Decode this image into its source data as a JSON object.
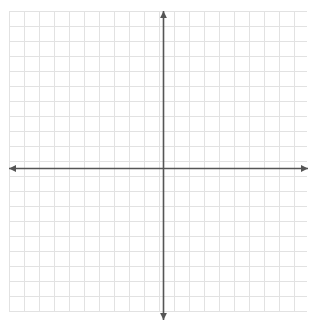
{
  "figure": {
    "type": "blank-cartesian-grid",
    "title": "",
    "background_color": "#ffffff",
    "width": 317,
    "height": 333
  },
  "grid": {
    "line_color": "#e2e2e2",
    "line_width": 1,
    "cell_size": 15,
    "left": 9,
    "top": 11,
    "right": 307,
    "bottom": 312,
    "columns": 20,
    "rows": 20,
    "visible": true
  },
  "axes": {
    "color": "#555555",
    "line_width": 1.6,
    "arrowheads": true,
    "x_axis": {
      "name": "x-axis",
      "label": "",
      "position_y": 168,
      "start_x": 9,
      "end_x": 308,
      "tick_labels": []
    },
    "y_axis": {
      "name": "y-axis",
      "label": "",
      "position_x": 163,
      "start_y": 320,
      "end_y": 11,
      "tick_labels": []
    },
    "origin": {
      "x": 163,
      "y": 168,
      "label": ""
    }
  },
  "chart_data": {
    "type": "scatter",
    "title": "",
    "subtitle": "",
    "xlabel": "",
    "ylabel": "",
    "xlim": [
      -10,
      10
    ],
    "ylim": [
      -10,
      10
    ],
    "xticks": [
      -10,
      -9,
      -8,
      -7,
      -6,
      -5,
      -4,
      -3,
      -2,
      -1,
      0,
      1,
      2,
      3,
      4,
      5,
      6,
      7,
      8,
      9,
      10
    ],
    "yticks": [
      -10,
      -9,
      -8,
      -7,
      -6,
      -5,
      -4,
      -3,
      -2,
      -1,
      0,
      1,
      2,
      3,
      4,
      5,
      6,
      7,
      8,
      9,
      10
    ],
    "xtick_labels": [],
    "ytick_labels": [],
    "grid": true,
    "legend": null,
    "annotations": [],
    "series": [],
    "x": [],
    "values": [],
    "note": "Empty coordinate plane — no plotted data points, curves, or labels are rendered."
  }
}
